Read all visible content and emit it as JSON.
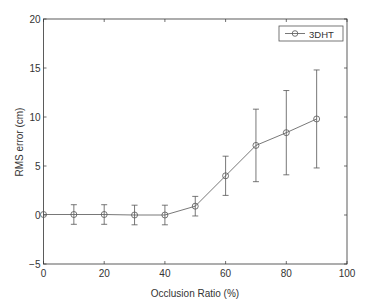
{
  "chart_data": {
    "type": "line",
    "title": "",
    "xlabel": "Occlusion Ratio (%)",
    "ylabel": "RMS error (cm)",
    "xlim": [
      0,
      100
    ],
    "ylim": [
      -5,
      20
    ],
    "xticks": [
      0,
      20,
      40,
      60,
      80,
      100
    ],
    "yticks": [
      -5,
      0,
      5,
      10,
      15,
      20
    ],
    "grid": false,
    "legend_position": "upper right",
    "x": [
      0,
      10,
      20,
      30,
      40,
      50,
      60,
      70,
      80,
      90
    ],
    "series": [
      {
        "name": "3DHT",
        "marker": "circle",
        "values": [
          0.05,
          0.05,
          0.05,
          0.0,
          0.0,
          0.9,
          4.0,
          7.1,
          8.4,
          9.8
        ],
        "error": [
          0,
          1.0,
          1.0,
          1.0,
          1.0,
          1.0,
          2.0,
          3.7,
          4.3,
          5.0
        ]
      }
    ]
  },
  "axis": {
    "xlabel": "Occlusion Ratio (%)",
    "ylabel": "RMS error (cm)",
    "xtick_labels": [
      "0",
      "20",
      "40",
      "60",
      "80",
      "100"
    ],
    "ytick_labels": [
      "−5",
      "0",
      "5",
      "10",
      "15",
      "20"
    ]
  },
  "legend": {
    "label": "3DHT"
  },
  "colors": {
    "line": "#555555",
    "axis": "#333333"
  }
}
